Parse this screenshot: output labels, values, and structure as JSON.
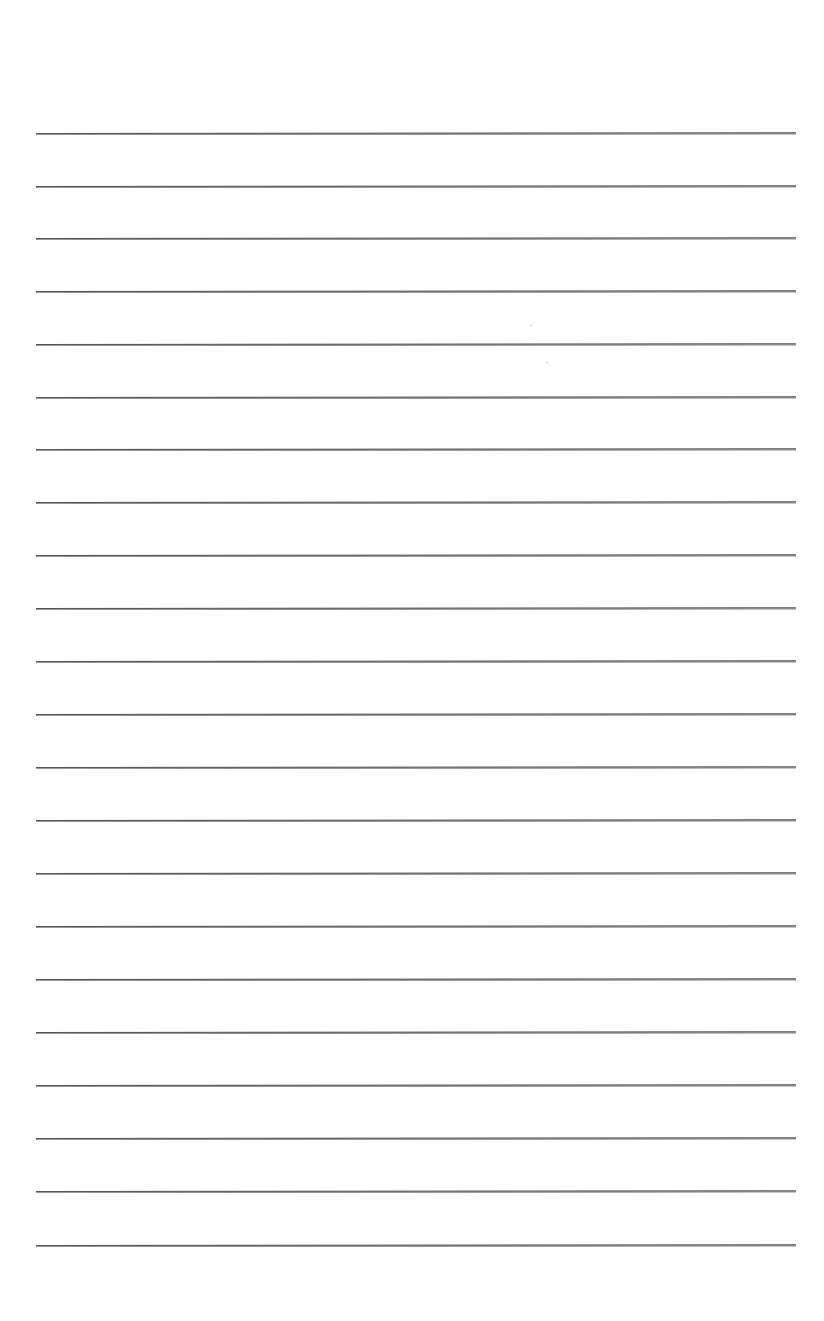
{
  "page": {
    "type": "lined-paper",
    "background_color": "#ffffff",
    "rule_color": "#555555",
    "rule_count": 22,
    "rule_left_px": 36,
    "rule_right_px": 796,
    "rule_positions_px": [
      133,
      186,
      238,
      291,
      344,
      397,
      449,
      502,
      555,
      608,
      661,
      714,
      767,
      820,
      873,
      926,
      979,
      1032,
      1085,
      1138,
      1191,
      1245
    ],
    "text_content": []
  }
}
